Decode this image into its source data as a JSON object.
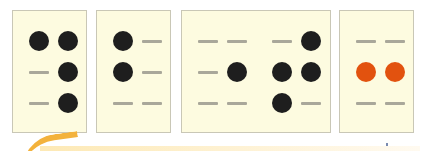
{
  "diagram": {
    "colors": {
      "card_bg": "#fdfbe0",
      "card_border": "#c9c7b6",
      "dot_black": "#1e1e1e",
      "dot_orange": "#e2520f",
      "dash": "#a9a79a",
      "swoosh": "#f3b23c"
    },
    "cards": [
      {
        "id": 1,
        "cells": [
          [
            "dot",
            "dot"
          ],
          [
            "dash",
            "dot"
          ],
          [
            "dash",
            "dot"
          ]
        ],
        "color": "black"
      },
      {
        "id": 2,
        "cells": [
          [
            "dot",
            "dash"
          ],
          [
            "dot",
            "dash"
          ],
          [
            "dash",
            "dash"
          ]
        ],
        "color": "black"
      },
      {
        "id": 3,
        "cells": [
          [
            "dash",
            "dash"
          ],
          [
            "dash",
            "dot"
          ],
          [
            "dash",
            "dash"
          ]
        ],
        "color": "black",
        "joined_with_next": true
      },
      {
        "id": 4,
        "cells": [
          [
            "dash",
            "dot"
          ],
          [
            "dot",
            "dot"
          ],
          [
            "dot",
            "dash"
          ]
        ],
        "color": "black"
      },
      {
        "id": 5,
        "cells": [
          [
            "dash",
            "dash"
          ],
          [
            "dot",
            "dot"
          ],
          [
            "dash",
            "dash"
          ]
        ],
        "color": "orange"
      }
    ]
  }
}
